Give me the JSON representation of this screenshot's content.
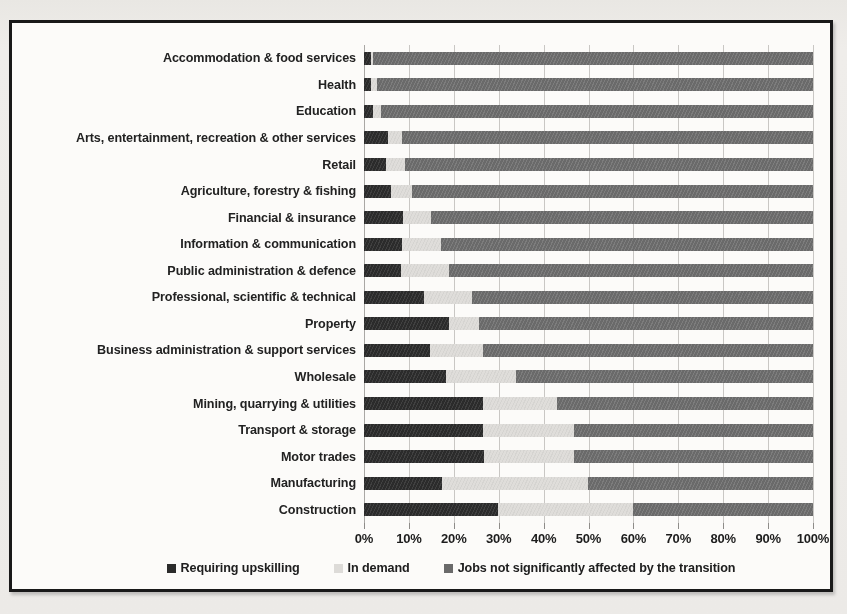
{
  "chart_data": {
    "type": "bar",
    "orientation": "horizontal",
    "stacked": true,
    "normalized": "100%",
    "title": "",
    "xlabel": "",
    "ylabel": "",
    "xlim": [
      0,
      100
    ],
    "grid": true,
    "legend_position": "bottom",
    "xticks": [
      "0%",
      "10%",
      "20%",
      "30%",
      "40%",
      "50%",
      "60%",
      "70%",
      "80%",
      "90%",
      "100%"
    ],
    "xtick_values": [
      0,
      10,
      20,
      30,
      40,
      50,
      60,
      70,
      80,
      90,
      100
    ],
    "categories": [
      "Accommodation & food services",
      "Health",
      "Education",
      "Arts, entertainment, recreation & other services",
      "Retail",
      "Agriculture, forestry & fishing",
      "Financial & insurance",
      "Information & communication",
      "Public administration & defence",
      "Professional, scientific & technical",
      "Property",
      "Business administration & support services",
      "Wholesale",
      "Mining, quarrying & utilities",
      "Transport & storage",
      "Motor trades",
      "Manufacturing",
      "Construction"
    ],
    "series": [
      {
        "name": "Requiring upskilling",
        "color": "#2d2d2d",
        "values": [
          1.5,
          1.6,
          2.0,
          5.4,
          5.0,
          6.1,
          8.7,
          8.4,
          8.2,
          13.4,
          19.0,
          14.7,
          18.2,
          26.6,
          26.6,
          26.8,
          17.4,
          29.8
        ]
      },
      {
        "name": "In demand",
        "color": "#dcdad7",
        "values": [
          0.6,
          1.2,
          1.9,
          3.0,
          4.1,
          4.6,
          6.2,
          8.8,
          10.8,
          10.6,
          6.6,
          11.7,
          15.7,
          16.4,
          20.2,
          20.0,
          32.6,
          30.2
        ]
      },
      {
        "name": "Jobs not significantly affected by the transition",
        "color": "#6b6b6b",
        "values": [
          97.9,
          97.2,
          96.1,
          91.6,
          90.9,
          89.3,
          85.1,
          82.8,
          81.0,
          76.0,
          74.4,
          73.6,
          66.1,
          57.0,
          53.2,
          53.2,
          50.0,
          40.0
        ]
      }
    ]
  },
  "legend": {
    "items": [
      {
        "label": "Requiring upskilling",
        "swatch": "legend-swatch-dark"
      },
      {
        "label": "In demand",
        "swatch": "legend-swatch-light"
      },
      {
        "label": "Jobs not significantly affected by the transition",
        "swatch": "legend-swatch-mid"
      }
    ]
  }
}
